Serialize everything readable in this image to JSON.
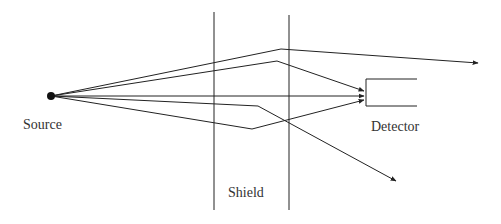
{
  "labels": {
    "source": "Source",
    "shield": "Shield",
    "detector": "Detector"
  },
  "colors": {
    "line": "#222222",
    "text": "#333333"
  },
  "geometry": {
    "source_point": [
      51,
      96
    ],
    "shield_lines_x": [
      214,
      289
    ],
    "shield_y_range": [
      12,
      210
    ],
    "detector_box": {
      "left": 366,
      "top": 79,
      "bottom": 106,
      "right": 417
    },
    "rays": [
      {
        "name": "scattered-away-upper",
        "points": [
          [
            51,
            96
          ],
          [
            281,
            49
          ],
          [
            478,
            63
          ]
        ],
        "arrow": true
      },
      {
        "name": "scattered-to-detector-upper",
        "points": [
          [
            51,
            96
          ],
          [
            277,
            61
          ],
          [
            364,
            91
          ]
        ],
        "arrow": true
      },
      {
        "name": "direct-to-detector",
        "points": [
          [
            51,
            96
          ],
          [
            364,
            96
          ]
        ],
        "arrow": true
      },
      {
        "name": "scattered-away-lower",
        "points": [
          [
            51,
            96
          ],
          [
            258,
            106
          ],
          [
            396,
            181
          ]
        ],
        "arrow": true
      },
      {
        "name": "scattered-to-detector-lower",
        "points": [
          [
            51,
            96
          ],
          [
            252,
            129
          ],
          [
            364,
            100
          ]
        ],
        "arrow": true
      }
    ]
  }
}
